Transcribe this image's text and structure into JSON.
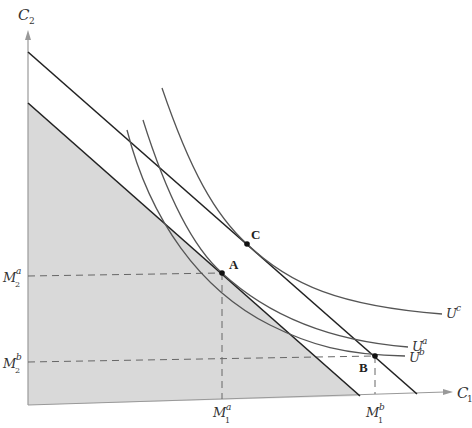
{
  "diagram": {
    "type": "economics-indifference-curves",
    "axes": {
      "x_label": {
        "base": "C",
        "sub": "1"
      },
      "y_label": {
        "base": "C",
        "sub": "2"
      }
    },
    "budget_lines": [
      {
        "name": "upper-budget-line",
        "from": [
          28,
          52
        ],
        "to": [
          417,
          394
        ]
      },
      {
        "name": "lower-budget-line",
        "from": [
          28,
          103
        ],
        "to": [
          360,
          396
        ],
        "shaded_region": true
      }
    ],
    "shade_color": "#d9d9d9",
    "line_color": "#222222",
    "curve_color": "#555555",
    "indifference_curves": [
      {
        "name": "U^c",
        "base": "U",
        "sup": "c"
      },
      {
        "name": "U^a",
        "base": "U",
        "sup": "a"
      },
      {
        "name": "U^b",
        "base": "U",
        "sup": "b"
      }
    ],
    "points": [
      {
        "label": "A",
        "x": 222,
        "y": 273
      },
      {
        "label": "B",
        "x": 375,
        "y": 356
      },
      {
        "label": "C",
        "x": 247,
        "y": 244
      }
    ],
    "tick_labels": {
      "M2a": {
        "base": "M",
        "sub": "2",
        "sup": "a"
      },
      "M2b": {
        "base": "M",
        "sub": "2",
        "sup": "b"
      },
      "M1a": {
        "base": "M",
        "sub": "1",
        "sup": "a"
      },
      "M1b": {
        "base": "M",
        "sub": "1",
        "sup": "b"
      }
    }
  }
}
